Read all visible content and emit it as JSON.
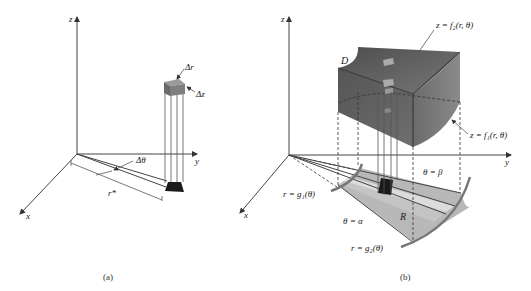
{
  "panel_a": {
    "axis_labels": {
      "z": "z",
      "y": "y",
      "x": "x"
    },
    "labels": {
      "delta_r": "Δr",
      "delta_z": "Δz",
      "delta_theta": "Δθ",
      "r_star": "r*"
    },
    "caption": "(a)"
  },
  "panel_b": {
    "axis_labels": {
      "z": "z",
      "y": "y",
      "x": "x"
    },
    "labels": {
      "D": "D",
      "top_surface": "z = f₂(r,  θ)",
      "bottom_surface": "z = f₁(r,  θ)",
      "theta_beta": "θ = β",
      "theta_alpha": "θ = α",
      "inner_curve": "r = g₁(θ)",
      "outer_curve": "r = g₂(θ)",
      "region": "R"
    },
    "caption": "(b)"
  },
  "colors": {
    "solid_top": "#6a6a6a",
    "solid_front": "#5a5a5a",
    "solid_side": "#7a7a7a",
    "region_mid": "#b4b4b4",
    "region_light": "#d6d6d6",
    "element_dark": "#1a1a1a"
  }
}
